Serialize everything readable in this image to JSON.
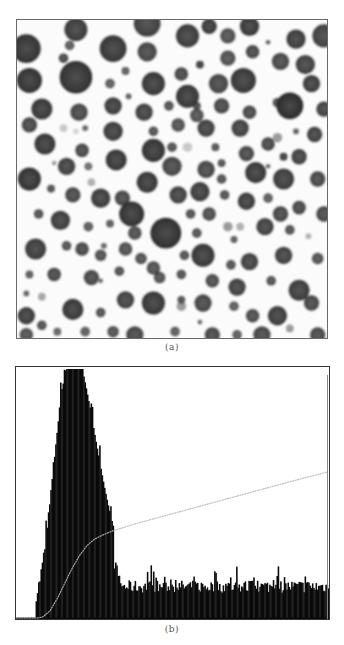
{
  "figure": {
    "caption_a": "(a)",
    "caption_b": "(b)"
  },
  "image_a": {
    "description": "micrograph of dark circular particles on white background",
    "particles": [
      [
        0.03,
        0.09,
        0.075,
        0.15
      ],
      [
        0.19,
        0.03,
        0.06,
        0.2
      ],
      [
        0.42,
        0.01,
        0.07,
        0.22
      ],
      [
        0.55,
        0.05,
        0.06,
        0.2
      ],
      [
        0.68,
        0.05,
        0.04,
        0.3
      ],
      [
        0.9,
        0.06,
        0.05,
        0.2
      ],
      [
        0.75,
        0.02,
        0.05,
        0.18
      ],
      [
        0.62,
        0.02,
        0.04,
        0.18
      ],
      [
        0.99,
        0.05,
        0.06,
        0.22
      ],
      [
        0.17,
        0.08,
        0.025,
        0.35
      ],
      [
        0.31,
        0.09,
        0.07,
        0.18
      ],
      [
        0.42,
        0.1,
        0.05,
        0.25
      ],
      [
        0.53,
        0.17,
        0.035,
        0.25
      ],
      [
        0.68,
        0.12,
        0.04,
        0.3
      ],
      [
        0.76,
        0.1,
        0.035,
        0.25
      ],
      [
        0.85,
        0.13,
        0.045,
        0.25
      ],
      [
        0.93,
        0.14,
        0.05,
        0.22
      ],
      [
        0.59,
        0.14,
        0.02,
        0.2
      ],
      [
        0.81,
        0.07,
        0.012,
        0.35
      ],
      [
        0.15,
        0.12,
        0.025,
        0.25
      ],
      [
        0.04,
        0.19,
        0.065,
        0.15
      ],
      [
        0.19,
        0.18,
        0.085,
        0.15
      ],
      [
        0.35,
        0.16,
        0.02,
        0.35
      ],
      [
        0.44,
        0.2,
        0.06,
        0.18
      ],
      [
        0.55,
        0.24,
        0.06,
        0.18
      ],
      [
        0.65,
        0.2,
        0.05,
        0.25
      ],
      [
        0.73,
        0.19,
        0.065,
        0.18
      ],
      [
        0.84,
        0.26,
        0.025,
        0.3
      ],
      [
        0.95,
        0.2,
        0.045,
        0.2
      ],
      [
        0.3,
        0.2,
        0.025,
        0.35
      ],
      [
        0.36,
        0.24,
        0.015,
        0.35
      ],
      [
        0.08,
        0.28,
        0.055,
        0.18
      ],
      [
        0.2,
        0.29,
        0.045,
        0.25
      ],
      [
        0.31,
        0.27,
        0.045,
        0.2
      ],
      [
        0.41,
        0.29,
        0.045,
        0.22
      ],
      [
        0.49,
        0.27,
        0.025,
        0.3
      ],
      [
        0.58,
        0.3,
        0.035,
        0.3
      ],
      [
        0.66,
        0.27,
        0.04,
        0.25
      ],
      [
        0.75,
        0.29,
        0.035,
        0.25
      ],
      [
        0.88,
        0.27,
        0.07,
        0.12
      ],
      [
        0.99,
        0.28,
        0.04,
        0.22
      ],
      [
        0.58,
        0.27,
        0.02,
        0.25
      ],
      [
        0.04,
        0.33,
        0.04,
        0.25
      ],
      [
        0.15,
        0.34,
        0.02,
        0.7
      ],
      [
        0.19,
        0.35,
        0.015,
        0.75
      ],
      [
        0.22,
        0.34,
        0.015,
        0.4
      ],
      [
        0.31,
        0.35,
        0.05,
        0.2
      ],
      [
        0.44,
        0.35,
        0.025,
        0.3
      ],
      [
        0.52,
        0.33,
        0.035,
        0.3
      ],
      [
        0.61,
        0.34,
        0.045,
        0.22
      ],
      [
        0.72,
        0.34,
        0.045,
        0.22
      ],
      [
        0.84,
        0.37,
        0.025,
        0.5
      ],
      [
        0.9,
        0.35,
        0.015,
        0.35
      ],
      [
        0.96,
        0.36,
        0.04,
        0.22
      ],
      [
        0.09,
        0.39,
        0.055,
        0.18
      ],
      [
        0.21,
        0.41,
        0.035,
        0.25
      ],
      [
        0.32,
        0.44,
        0.055,
        0.18
      ],
      [
        0.44,
        0.41,
        0.06,
        0.16
      ],
      [
        0.5,
        0.4,
        0.025,
        0.3
      ],
      [
        0.55,
        0.4,
        0.025,
        0.7
      ],
      [
        0.64,
        0.4,
        0.02,
        0.3
      ],
      [
        0.74,
        0.42,
        0.04,
        0.25
      ],
      [
        0.81,
        0.39,
        0.035,
        0.25
      ],
      [
        0.91,
        0.43,
        0.04,
        0.22
      ],
      [
        0.86,
        0.43,
        0.02,
        0.2
      ],
      [
        0.04,
        0.5,
        0.06,
        0.15
      ],
      [
        0.16,
        0.46,
        0.045,
        0.22
      ],
      [
        0.23,
        0.46,
        0.02,
        0.45
      ],
      [
        0.24,
        0.51,
        0.02,
        0.6
      ],
      [
        0.12,
        0.45,
        0.012,
        0.5
      ],
      [
        0.34,
        0.56,
        0.04,
        0.25
      ],
      [
        0.42,
        0.51,
        0.055,
        0.18
      ],
      [
        0.5,
        0.46,
        0.05,
        0.25
      ],
      [
        0.61,
        0.47,
        0.045,
        0.25
      ],
      [
        0.66,
        0.45,
        0.02,
        0.3
      ],
      [
        0.77,
        0.48,
        0.055,
        0.18
      ],
      [
        0.86,
        0.5,
        0.055,
        0.2
      ],
      [
        0.97,
        0.5,
        0.04,
        0.25
      ],
      [
        0.66,
        0.5,
        0.025,
        0.3
      ],
      [
        0.81,
        0.46,
        0.012,
        0.4
      ],
      [
        0.11,
        0.53,
        0.02,
        0.3
      ],
      [
        0.18,
        0.55,
        0.04,
        0.25
      ],
      [
        0.27,
        0.56,
        0.05,
        0.2
      ],
      [
        0.37,
        0.61,
        0.065,
        0.15
      ],
      [
        0.52,
        0.55,
        0.045,
        0.22
      ],
      [
        0.59,
        0.54,
        0.05,
        0.2
      ],
      [
        0.67,
        0.55,
        0.025,
        0.3
      ],
      [
        0.74,
        0.57,
        0.045,
        0.2
      ],
      [
        0.81,
        0.56,
        0.025,
        0.35
      ],
      [
        0.91,
        0.59,
        0.035,
        0.25
      ],
      [
        0.85,
        0.61,
        0.04,
        0.25
      ],
      [
        0.07,
        0.61,
        0.025,
        0.3
      ],
      [
        0.14,
        0.63,
        0.05,
        0.2
      ],
      [
        0.23,
        0.65,
        0.025,
        0.35
      ],
      [
        0.3,
        0.64,
        0.02,
        0.35
      ],
      [
        0.48,
        0.67,
        0.08,
        0.14
      ],
      [
        0.56,
        0.61,
        0.025,
        0.3
      ],
      [
        0.62,
        0.61,
        0.035,
        0.28
      ],
      [
        0.68,
        0.65,
        0.025,
        0.5
      ],
      [
        0.72,
        0.65,
        0.02,
        0.6
      ],
      [
        0.8,
        0.65,
        0.045,
        0.22
      ],
      [
        0.88,
        0.66,
        0.025,
        0.3
      ],
      [
        0.99,
        0.61,
        0.04,
        0.25
      ],
      [
        0.58,
        0.67,
        0.025,
        0.3
      ],
      [
        0.7,
        0.69,
        0.018,
        0.35
      ],
      [
        0.94,
        0.68,
        0.015,
        0.6
      ],
      [
        0.06,
        0.72,
        0.055,
        0.2
      ],
      [
        0.16,
        0.71,
        0.025,
        0.3
      ],
      [
        0.21,
        0.72,
        0.035,
        0.25
      ],
      [
        0.27,
        0.74,
        0.03,
        0.3
      ],
      [
        0.35,
        0.72,
        0.035,
        0.3
      ],
      [
        0.4,
        0.75,
        0.03,
        0.3
      ],
      [
        0.44,
        0.78,
        0.035,
        0.3
      ],
      [
        0.54,
        0.74,
        0.025,
        0.3
      ],
      [
        0.6,
        0.74,
        0.06,
        0.18
      ],
      [
        0.69,
        0.77,
        0.025,
        0.3
      ],
      [
        0.75,
        0.76,
        0.045,
        0.22
      ],
      [
        0.86,
        0.74,
        0.045,
        0.22
      ],
      [
        0.97,
        0.75,
        0.03,
        0.3
      ],
      [
        0.28,
        0.71,
        0.015,
        0.4
      ],
      [
        0.38,
        0.67,
        0.035,
        0.28
      ],
      [
        0.04,
        0.8,
        0.02,
        0.35
      ],
      [
        0.12,
        0.8,
        0.035,
        0.25
      ],
      [
        0.24,
        0.81,
        0.04,
        0.25
      ],
      [
        0.33,
        0.79,
        0.025,
        0.3
      ],
      [
        0.46,
        0.81,
        0.03,
        0.3
      ],
      [
        0.53,
        0.8,
        0.025,
        0.3
      ],
      [
        0.63,
        0.82,
        0.035,
        0.28
      ],
      [
        0.71,
        0.84,
        0.045,
        0.22
      ],
      [
        0.82,
        0.82,
        0.025,
        0.3
      ],
      [
        0.91,
        0.85,
        0.055,
        0.2
      ],
      [
        0.27,
        0.82,
        0.012,
        0.4
      ],
      [
        0.03,
        0.86,
        0.015,
        0.4
      ],
      [
        0.08,
        0.87,
        0.02,
        0.55
      ],
      [
        0.18,
        0.91,
        0.055,
        0.18
      ],
      [
        0.27,
        0.92,
        0.025,
        0.3
      ],
      [
        0.35,
        0.88,
        0.045,
        0.22
      ],
      [
        0.44,
        0.89,
        0.06,
        0.18
      ],
      [
        0.53,
        0.9,
        0.025,
        0.5
      ],
      [
        0.6,
        0.89,
        0.045,
        0.25
      ],
      [
        0.7,
        0.9,
        0.025,
        0.35
      ],
      [
        0.76,
        0.93,
        0.035,
        0.28
      ],
      [
        0.84,
        0.93,
        0.05,
        0.2
      ],
      [
        0.95,
        0.89,
        0.04,
        0.25
      ],
      [
        0.53,
        0.88,
        0.02,
        0.3
      ],
      [
        0.59,
        0.95,
        0.012,
        0.4
      ],
      [
        0.03,
        0.93,
        0.045,
        0.2
      ],
      [
        0.08,
        0.96,
        0.025,
        0.3
      ],
      [
        0.13,
        0.98,
        0.02,
        0.4
      ],
      [
        0.22,
        0.98,
        0.025,
        0.35
      ],
      [
        0.31,
        0.98,
        0.03,
        0.3
      ],
      [
        0.38,
        0.99,
        0.045,
        0.25
      ],
      [
        0.51,
        0.98,
        0.025,
        0.35
      ],
      [
        0.63,
        0.99,
        0.04,
        0.25
      ],
      [
        0.71,
        0.99,
        0.025,
        0.35
      ],
      [
        0.79,
        0.99,
        0.045,
        0.25
      ],
      [
        0.88,
        0.97,
        0.02,
        0.5
      ],
      [
        0.97,
        0.99,
        0.04,
        0.25
      ],
      [
        0.03,
        0.99,
        0.035,
        0.3
      ]
    ]
  },
  "chart_data": {
    "type": "bar",
    "title": "",
    "xlabel": "",
    "ylabel": "",
    "x_range": [
      0,
      255
    ],
    "ylim": [
      0,
      1.0
    ],
    "grid": false,
    "legend": "none",
    "series": [
      {
        "name": "histogram",
        "kind": "bar",
        "shape": {
          "zero_until_bin": 15,
          "rise_start_bin": 16,
          "peak_bin": 42,
          "peak_value": 1.0,
          "peak_spread_left": 12,
          "peak_spread_right": 22,
          "tail_value": 0.13,
          "tail_start_bin": 80,
          "noise": 0.025,
          "spike_prob": 0.08,
          "spike_value": 0.035
        }
      },
      {
        "name": "cumulative",
        "kind": "line",
        "color": "#b8b8b8",
        "points": [
          [
            0,
            0
          ],
          [
            18,
            0
          ],
          [
            22,
            0.005
          ],
          [
            28,
            0.03
          ],
          [
            34,
            0.08
          ],
          [
            40,
            0.14
          ],
          [
            46,
            0.2
          ],
          [
            52,
            0.25
          ],
          [
            58,
            0.29
          ],
          [
            64,
            0.315
          ],
          [
            70,
            0.33
          ],
          [
            80,
            0.35
          ],
          [
            100,
            0.38
          ],
          [
            130,
            0.42
          ],
          [
            160,
            0.46
          ],
          [
            190,
            0.5
          ],
          [
            220,
            0.54
          ],
          [
            255,
            0.585
          ]
        ]
      }
    ]
  }
}
